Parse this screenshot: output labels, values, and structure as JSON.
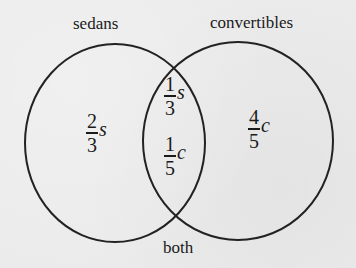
{
  "diagram": {
    "type": "venn",
    "sets": [
      {
        "name": "sedans",
        "label": "sedans"
      },
      {
        "name": "convertibles",
        "label": "convertibles"
      }
    ],
    "intersection_label": "both",
    "regions": {
      "sedans_only": {
        "numerator": "2",
        "denominator": "3",
        "variable": "s"
      },
      "both_s": {
        "numerator": "1",
        "denominator": "3",
        "variable": "s"
      },
      "both_c": {
        "numerator": "1",
        "denominator": "5",
        "variable": "c"
      },
      "convertibles_only": {
        "numerator": "4",
        "denominator": "5",
        "variable": "c"
      }
    },
    "colors": {
      "stroke": "#222222",
      "background": "#ebebeb",
      "text": "#1a1a1a"
    }
  }
}
